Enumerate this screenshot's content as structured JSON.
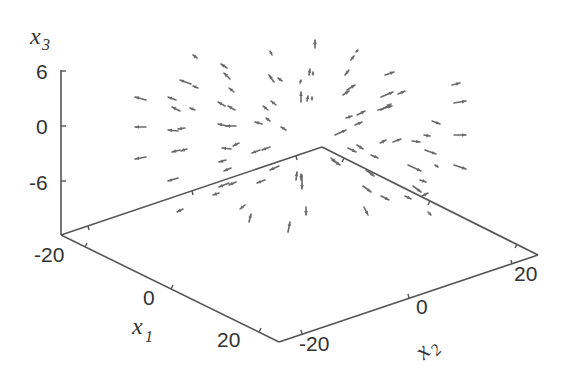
{
  "chart_data": {
    "type": "quiver3d",
    "title": "",
    "axes": {
      "x1": {
        "label": "x",
        "label_sub": "1",
        "ticks": [
          "-20",
          "0",
          "20"
        ],
        "range": [
          -20,
          20
        ]
      },
      "x2": {
        "label": "x",
        "label_sub": "2",
        "ticks": [
          "-20",
          "0",
          "20"
        ],
        "range": [
          -20,
          20
        ]
      },
      "x3": {
        "label": "x",
        "label_sub": "3",
        "ticks": [
          "6",
          "0",
          "-6"
        ],
        "range": [
          -6,
          6
        ]
      }
    },
    "grid": false,
    "legend": null,
    "box_corners_px": {
      "z_top": [
        61,
        70
      ],
      "origin_left": [
        61,
        235
      ],
      "back": [
        322,
        147
      ],
      "right": [
        538,
        255
      ],
      "front": [
        279,
        342
      ]
    },
    "arrows_px": [
      [
        146,
        100,
        135,
        97
      ],
      [
        146,
        127,
        135,
        127
      ],
      [
        146,
        157,
        135,
        159
      ],
      [
        193,
        55,
        197,
        58
      ],
      [
        191,
        84,
        180,
        80
      ],
      [
        198,
        88,
        193,
        86
      ],
      [
        176,
        100,
        168,
        97
      ],
      [
        180,
        111,
        172,
        107
      ],
      [
        195,
        110,
        190,
        108
      ],
      [
        178,
        131,
        168,
        130
      ],
      [
        185,
        128,
        178,
        129
      ],
      [
        180,
        150,
        172,
        152
      ],
      [
        187,
        149,
        181,
        151
      ],
      [
        178,
        178,
        168,
        181
      ],
      [
        183,
        209,
        177,
        212
      ],
      [
        227,
        68,
        221,
        64
      ],
      [
        230,
        79,
        224,
        73
      ],
      [
        234,
        92,
        229,
        88
      ],
      [
        225,
        106,
        218,
        102
      ],
      [
        235,
        110,
        228,
        106
      ],
      [
        227,
        126,
        218,
        124
      ],
      [
        236,
        126,
        226,
        126
      ],
      [
        231,
        149,
        222,
        148
      ],
      [
        239,
        143,
        233,
        146
      ],
      [
        226,
        160,
        219,
        162
      ],
      [
        229,
        183,
        219,
        187
      ],
      [
        236,
        182,
        229,
        185
      ],
      [
        219,
        193,
        213,
        195
      ],
      [
        231,
        168,
        224,
        171
      ],
      [
        272,
        55,
        270,
        51
      ],
      [
        274,
        82,
        269,
        75
      ],
      [
        282,
        81,
        278,
        78
      ],
      [
        268,
        110,
        263,
        106
      ],
      [
        276,
        105,
        271,
        101
      ],
      [
        262,
        124,
        255,
        122
      ],
      [
        270,
        121,
        266,
        118
      ],
      [
        286,
        130,
        281,
        127
      ],
      [
        260,
        150,
        252,
        153
      ],
      [
        270,
        147,
        262,
        150
      ],
      [
        279,
        166,
        270,
        170
      ],
      [
        265,
        180,
        257,
        183
      ],
      [
        245,
        205,
        240,
        209
      ],
      [
        249,
        222,
        251,
        214
      ],
      [
        315,
        48,
        315,
        40
      ],
      [
        309,
        75,
        310,
        69
      ],
      [
        313,
        75,
        313,
        72
      ],
      [
        301,
        102,
        301,
        92
      ],
      [
        307,
        101,
        308,
        96
      ],
      [
        312,
        100,
        312,
        97
      ],
      [
        300,
        83,
        301,
        80
      ],
      [
        296,
        180,
        297,
        172
      ],
      [
        301,
        180,
        301,
        174
      ],
      [
        302,
        175,
        302,
        189
      ],
      [
        288,
        232,
        290,
        222
      ],
      [
        306,
        207,
        306,
        215
      ],
      [
        351,
        60,
        354,
        56
      ],
      [
        345,
        75,
        349,
        70
      ],
      [
        356,
        52,
        358,
        50
      ],
      [
        347,
        90,
        355,
        85
      ],
      [
        343,
        95,
        349,
        91
      ],
      [
        357,
        115,
        365,
        111
      ],
      [
        346,
        118,
        352,
        116
      ],
      [
        355,
        125,
        362,
        122
      ],
      [
        335,
        135,
        346,
        130
      ],
      [
        348,
        148,
        356,
        152
      ],
      [
        371,
        155,
        378,
        158
      ],
      [
        366,
        170,
        374,
        176
      ],
      [
        363,
        186,
        371,
        192
      ],
      [
        381,
        196,
        389,
        200
      ],
      [
        364,
        207,
        368,
        215
      ],
      [
        332,
        160,
        340,
        165
      ],
      [
        331,
        158,
        336,
        162
      ],
      [
        385,
        75,
        394,
        72
      ],
      [
        381,
        97,
        393,
        92
      ],
      [
        378,
        110,
        392,
        106
      ],
      [
        381,
        110,
        391,
        104
      ],
      [
        357,
        145,
        363,
        149
      ],
      [
        398,
        94,
        405,
        91
      ],
      [
        380,
        143,
        386,
        140
      ],
      [
        393,
        142,
        401,
        139
      ],
      [
        424,
        135,
        430,
        136
      ],
      [
        432,
        121,
        440,
        124
      ],
      [
        412,
        141,
        420,
        142
      ],
      [
        425,
        150,
        436,
        154
      ],
      [
        408,
        165,
        421,
        171
      ],
      [
        420,
        180,
        426,
        182
      ],
      [
        413,
        186,
        421,
        192
      ],
      [
        405,
        196,
        411,
        199
      ],
      [
        452,
        85,
        460,
        83
      ],
      [
        454,
        103,
        466,
        101
      ],
      [
        454,
        135,
        466,
        135
      ],
      [
        454,
        165,
        466,
        169
      ],
      [
        435,
        165,
        438,
        167
      ],
      [
        428,
        212,
        431,
        215
      ],
      [
        422,
        196,
        428,
        193
      ]
    ]
  },
  "labels": {
    "x3_tick_6": "6",
    "x3_tick_0": "0",
    "x3_tick_m6": "-6",
    "x1_tick_m20": "-20",
    "x1_tick_0": "0",
    "x1_tick_20": "20",
    "x2_tick_m20": "-20",
    "x2_tick_0": "0",
    "x2_tick_20": "20",
    "x1_title": "x",
    "x1_sub": "1",
    "x2_title": "x",
    "x2_sub": "2",
    "x3_title": "x",
    "x3_sub": "3"
  },
  "colors": {
    "axis": "#555555",
    "arrow": "#6a6a6a",
    "text": "#333333",
    "background": "#ffffff"
  }
}
